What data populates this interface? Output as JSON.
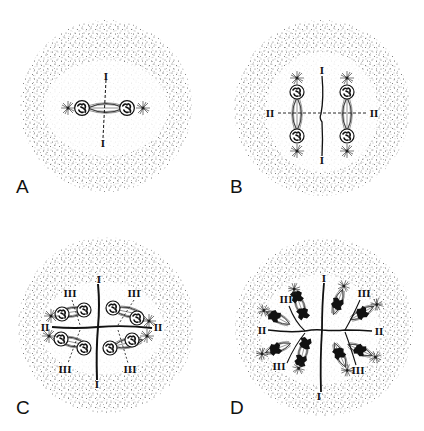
{
  "figure": {
    "type": "diagram",
    "colors": {
      "ink": "#111111",
      "stipple": "#6b6b6b",
      "background": "#ffffff"
    },
    "panels": [
      {
        "letter": "A",
        "center": [
          106,
          106
        ],
        "radius": 86,
        "labels": [
          {
            "text": "I",
            "x": 106,
            "y": 76
          },
          {
            "text": "I",
            "x": 103,
            "y": 143
          }
        ]
      },
      {
        "letter": "B",
        "center": [
          322,
          108
        ],
        "radius": 88,
        "labels": [
          {
            "text": "I",
            "x": 322,
            "y": 73
          },
          {
            "text": "I",
            "x": 322,
            "y": 159
          },
          {
            "text": "II",
            "x": 272,
            "y": 117
          },
          {
            "text": "II",
            "x": 371,
            "y": 117
          }
        ]
      },
      {
        "letter": "C",
        "center": [
          106,
          325
        ],
        "radius": 88,
        "labels": [
          {
            "text": "I",
            "x": 99,
            "y": 280
          },
          {
            "text": "I",
            "x": 97,
            "y": 384
          },
          {
            "text": "II",
            "x": 47,
            "y": 330
          },
          {
            "text": "II",
            "x": 157,
            "y": 330
          },
          {
            "text": "III",
            "x": 70,
            "y": 294
          },
          {
            "text": "III",
            "x": 135,
            "y": 294
          },
          {
            "text": "III",
            "x": 65,
            "y": 371
          },
          {
            "text": "III",
            "x": 130,
            "y": 371
          }
        ]
      },
      {
        "letter": "D",
        "center": [
          324,
          327
        ],
        "radius": 89,
        "labels": [
          {
            "text": "I",
            "x": 324,
            "y": 279
          },
          {
            "text": "I",
            "x": 319,
            "y": 396
          },
          {
            "text": "II",
            "x": 262,
            "y": 333
          },
          {
            "text": "II",
            "x": 378,
            "y": 334
          },
          {
            "text": "III",
            "x": 287,
            "y": 303
          },
          {
            "text": "III",
            "x": 364,
            "y": 296
          },
          {
            "text": "III",
            "x": 279,
            "y": 368
          },
          {
            "text": "III",
            "x": 358,
            "y": 372
          }
        ]
      }
    ]
  },
  "labels": {
    "panel_a": "A",
    "panel_b": "B",
    "panel_c": "C",
    "panel_d": "D",
    "plane_1": "I",
    "plane_2": "II",
    "plane_3": "III"
  }
}
